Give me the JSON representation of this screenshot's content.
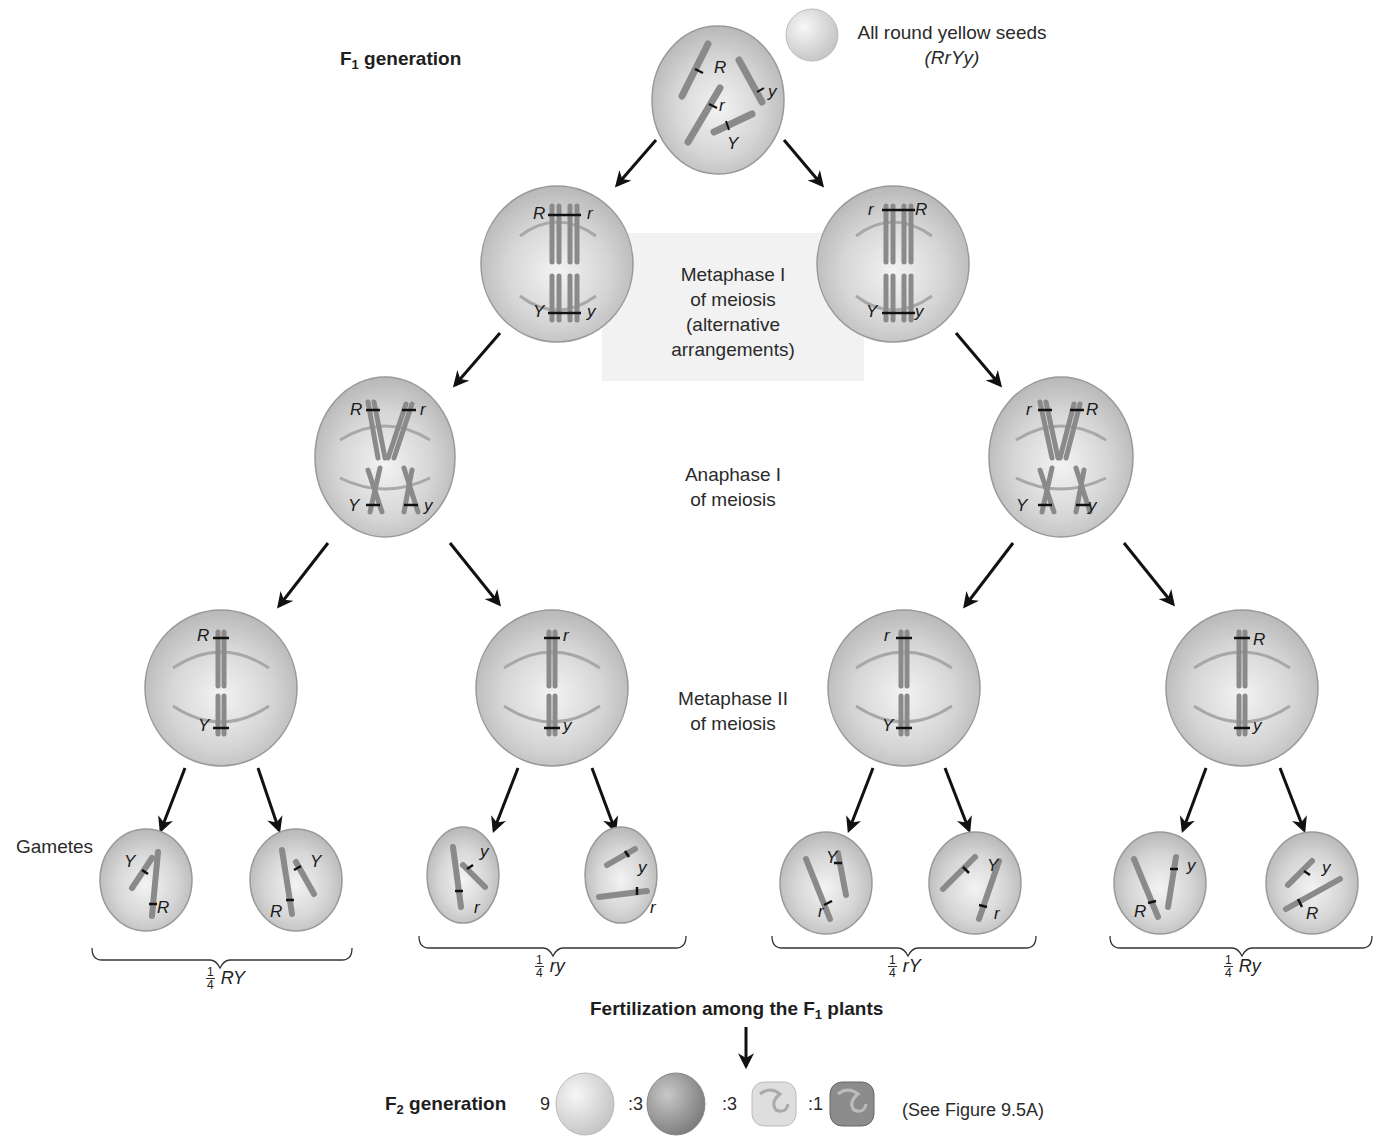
{
  "title": {
    "f1_prefix": "F",
    "f1_sub": "1",
    "f1_suffix": " generation"
  },
  "seed_note": {
    "line1": "All round yellow seeds",
    "line2": "(RrYy)"
  },
  "stages": {
    "metaphase1": [
      "Metaphase I",
      "of meiosis",
      "(alternative",
      "arrangements)"
    ],
    "anaphase1": [
      "Anaphase I",
      "of meiosis"
    ],
    "metaphase2": [
      "Metaphase II",
      "of meiosis"
    ],
    "gametes": "Gametes"
  },
  "alleles": {
    "f1": [
      "R",
      "r",
      "y",
      "Y"
    ],
    "meta1_left": [
      "R",
      "r",
      "Y",
      "y"
    ],
    "meta1_right": [
      "r",
      "R",
      "Y",
      "y"
    ],
    "ana1_left": [
      "R",
      "r",
      "Y",
      "y"
    ],
    "ana1_right": [
      "r",
      "R",
      "Y",
      "y"
    ],
    "meta2": [
      [
        "R",
        "Y"
      ],
      [
        "r",
        "y"
      ],
      [
        "r",
        "Y"
      ],
      [
        "R",
        "y"
      ]
    ],
    "gametes": [
      [
        "Y",
        "R"
      ],
      [
        "Y",
        "R"
      ],
      [
        "y",
        "r"
      ],
      [
        "y",
        "r"
      ],
      [
        "Y",
        "r"
      ],
      [
        "Y",
        "r"
      ],
      [
        "y",
        "R"
      ],
      [
        "y",
        "R"
      ]
    ]
  },
  "gamete_groups": [
    {
      "num": "1",
      "den": "4",
      "genotype": "RY"
    },
    {
      "num": "1",
      "den": "4",
      "genotype": "ry"
    },
    {
      "num": "1",
      "den": "4",
      "genotype": "rY"
    },
    {
      "num": "1",
      "den": "4",
      "genotype": "Ry"
    }
  ],
  "fertilization": {
    "prefix": "Fertilization among the F",
    "sub": "1",
    "suffix": " plants"
  },
  "f2": {
    "prefix": "F",
    "sub": "2",
    "suffix": " generation",
    "ratios": [
      "9",
      ":3",
      ":3",
      ":1"
    ],
    "phenotype_icons": [
      "round-yellow-seed-icon",
      "round-green-seed-icon",
      "wrinkled-yellow-seed-icon",
      "wrinkled-green-seed-icon"
    ],
    "reference": "(See Figure 9.5A)"
  },
  "colors": {
    "cell_fill": "#c9c9c9",
    "cell_center": "#efefef",
    "chromosome": "#8a8a8a",
    "arrow": "#111111",
    "seed_light": "#e2e2e2",
    "seed_dark": "#9d9d9d"
  }
}
